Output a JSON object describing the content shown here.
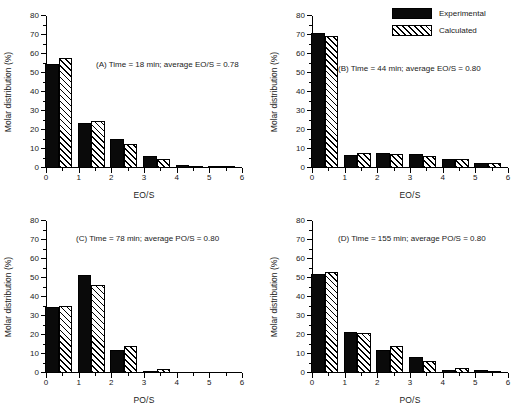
{
  "legend": {
    "position": "top-right",
    "entries": [
      {
        "label": "Experimental",
        "style": "solid-black"
      },
      {
        "label": "Calculated",
        "style": "diagonal-hatch"
      }
    ]
  },
  "axes": {
    "ylabel": "Molar distribution (%)",
    "yticks": [
      0,
      10,
      20,
      30,
      40,
      50,
      60,
      70,
      80
    ],
    "ylim": [
      0,
      80
    ],
    "xticks": [
      0,
      1,
      2,
      3,
      4,
      5,
      6
    ],
    "xlim": [
      0,
      6
    ],
    "grid": false
  },
  "chart_data": [
    {
      "type": "bar",
      "panel": "A",
      "title": "(A) Time = 18 min; average EO/S = 0.78",
      "xlabel": "EO/S",
      "ylabel": "Molar distribution (%)",
      "ylim": [
        0,
        80
      ],
      "xlim": [
        0,
        6
      ],
      "categories": [
        "0",
        "1",
        "2",
        "3",
        "4",
        "5",
        "6"
      ],
      "series": [
        {
          "name": "Experimental",
          "values": [
            54.5,
            23.5,
            15.3,
            6.2,
            1.8,
            0.2,
            0.0
          ]
        },
        {
          "name": "Calculated",
          "values": [
            57.8,
            24.5,
            12.5,
            4.5,
            1.2,
            0.2,
            0.0
          ]
        }
      ]
    },
    {
      "type": "bar",
      "panel": "B",
      "title": "(B) Time = 44 min; average EO/S = 0.80",
      "xlabel": "EO/S",
      "ylabel": "Molar distribution (%)",
      "ylim": [
        0,
        80
      ],
      "xlim": [
        0,
        6
      ],
      "categories": [
        "0",
        "1",
        "2",
        "3",
        "4",
        "5",
        "6"
      ],
      "series": [
        {
          "name": "Experimental",
          "values": [
            71.0,
            6.7,
            8.0,
            7.6,
            4.6,
            2.5,
            0.0
          ]
        },
        {
          "name": "Calculated",
          "values": [
            69.6,
            7.8,
            7.3,
            6.4,
            4.5,
            2.4,
            0.0
          ]
        }
      ]
    },
    {
      "type": "bar",
      "panel": "C",
      "title": "(C) Time = 78 min; average PO/S = 0.80",
      "xlabel": "PO/S",
      "ylabel": "Molar distribution (%)",
      "ylim": [
        0,
        80
      ],
      "xlim": [
        0,
        6
      ],
      "categories": [
        "0",
        "1",
        "2",
        "3",
        "4",
        "5",
        "6"
      ],
      "series": [
        {
          "name": "Experimental",
          "values": [
            34.7,
            51.8,
            12.3,
            1.0,
            0.0,
            0.0,
            0.0
          ]
        },
        {
          "name": "Calculated",
          "values": [
            35.5,
            46.5,
            14.0,
            2.2,
            0.0,
            0.0,
            0.0
          ]
        }
      ]
    },
    {
      "type": "bar",
      "panel": "D",
      "title": "(D) Time = 155 min; average PO/S = 0.80",
      "xlabel": "PO/S",
      "ylabel": "Molar distribution (%)",
      "ylim": [
        0,
        80
      ],
      "xlim": [
        0,
        6
      ],
      "categories": [
        "0",
        "1",
        "2",
        "3",
        "4",
        "5",
        "6"
      ],
      "series": [
        {
          "name": "Experimental",
          "values": [
            52.0,
            21.6,
            12.3,
            8.4,
            1.4,
            1.8,
            0.0
          ]
        },
        {
          "name": "Calculated",
          "values": [
            53.3,
            21.0,
            14.0,
            6.1,
            2.9,
            0.8,
            0.0
          ]
        }
      ]
    }
  ],
  "captions": {
    "a": "(A) Time = 18 min; average EO/S = 0.78",
    "b": "(B) Time = 44 min; average EO/S = 0.80",
    "c": "(C) Time = 78 min; average PO/S = 0.80",
    "d": "(D) Time = 155 min; average PO/S = 0.80"
  }
}
